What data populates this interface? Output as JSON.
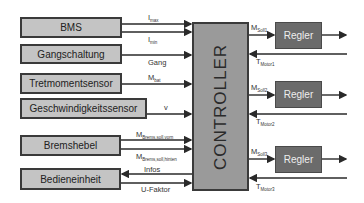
{
  "diagram": {
    "controller": {
      "label": "CONTROLLER"
    },
    "inputs": [
      {
        "id": "bms",
        "label": "BMS"
      },
      {
        "id": "gang",
        "label": "Gangschaltung"
      },
      {
        "id": "tret",
        "label": "Tretmomentsensor"
      },
      {
        "id": "geschw",
        "label": "Geschwindigkeitssensor"
      },
      {
        "id": "brems",
        "label": "Bremshebel"
      },
      {
        "id": "bedien",
        "label": "Bedieneinheit"
      }
    ],
    "signals": {
      "imax": {
        "main": "I",
        "sub": "max"
      },
      "imin": {
        "main": "I",
        "sub": "min"
      },
      "gang": {
        "main": "Gang",
        "sub": ""
      },
      "mbat": {
        "main": "M",
        "sub": "bat"
      },
      "v": {
        "main": "v",
        "sub": ""
      },
      "mbrems_vorn": {
        "main": "M",
        "sub": "Brems,soll,vorn"
      },
      "mbrems_hinten": {
        "main": "M",
        "sub": "Brems,soll,hinten"
      },
      "infos": {
        "main": "Infos",
        "sub": ""
      },
      "ufaktor": {
        "main": "U-Faktor",
        "sub": ""
      }
    },
    "regler": [
      {
        "label": "Regler",
        "msoll": {
          "main": "M",
          "sub": "Soll1"
        },
        "tmotor": {
          "main": "T",
          "sub": "Motor1"
        }
      },
      {
        "label": "Regler",
        "msoll": {
          "main": "M",
          "sub": "Soll2"
        },
        "tmotor": {
          "main": "T",
          "sub": "Motor2"
        }
      },
      {
        "label": "Regler",
        "msoll": {
          "main": "M",
          "sub": "Soll3"
        },
        "tmotor": {
          "main": "T",
          "sub": "Motor3"
        }
      }
    ],
    "colors": {
      "input_box": "#c4c4c4",
      "controller": "#9a9a9a",
      "regler": "#6b6b6b",
      "line": "#2a2a2a"
    }
  }
}
